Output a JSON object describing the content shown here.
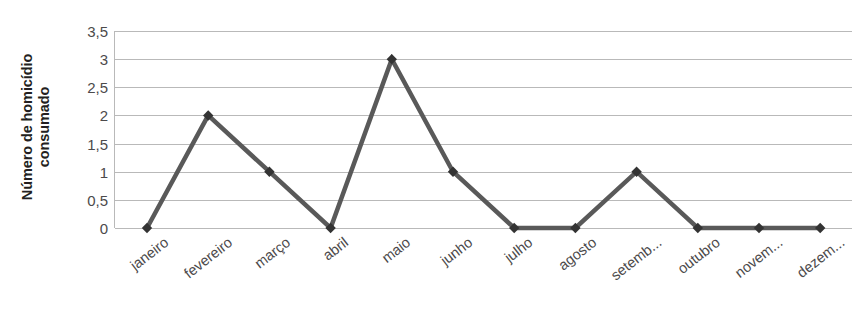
{
  "chart_data": {
    "type": "line",
    "title": "",
    "xlabel": "",
    "ylabel": "Número de homicídio consumado",
    "ylabel_lines": [
      "Número de homicídio",
      "consumado"
    ],
    "categories": [
      "janeiro",
      "fevereiro",
      "março",
      "abril",
      "maio",
      "junho",
      "julho",
      "agosto",
      "setemb...",
      "outubro",
      "novem...",
      "dezem..."
    ],
    "categories_full": [
      "janeiro",
      "fevereiro",
      "março",
      "abril",
      "maio",
      "junho",
      "julho",
      "agosto",
      "setembro",
      "outubro",
      "novembro",
      "dezembro"
    ],
    "values": [
      0,
      2,
      1,
      0,
      3,
      1,
      0,
      0,
      1,
      0,
      0,
      0
    ],
    "ylim": [
      0,
      3.5
    ],
    "ytick_labels": [
      "3,5",
      "3",
      "2,5",
      "2",
      "1,5",
      "1",
      "0,5",
      "0"
    ],
    "ytick_values": [
      3.5,
      3,
      2.5,
      2,
      1.5,
      1,
      0.5,
      0
    ],
    "grid": true,
    "legend": "none",
    "marker": "diamond",
    "colors": {
      "line": "#595959",
      "marker": "#333333",
      "grid": "#b9b9b9",
      "tick_text": "#4c4a4b",
      "axis_title": "#231f20",
      "background": "#ffffff"
    }
  }
}
